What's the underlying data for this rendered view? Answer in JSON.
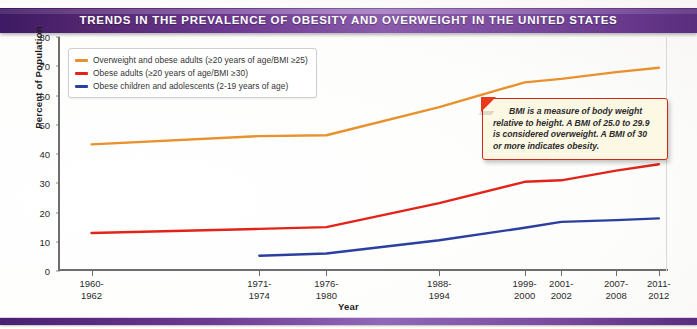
{
  "banner": {
    "title": "TRENDS IN THE PREVALENCE OF OBESITY AND OVERWEIGHT IN THE UNITED STATES"
  },
  "colors": {
    "banner_dark": "#3d1a63",
    "banner_light": "#8b5cab",
    "overweight_line": "#E8912D",
    "obese_adults_line": "#E32319",
    "obese_children_line": "#2B3F9E",
    "axis": "#6d6d6d",
    "callout_border": "#cf2a18",
    "callout_fill": "#fdf8e4"
  },
  "legend": {
    "items": [
      {
        "label": "Overweight and obese adults (≥20 years of age/BMI ≥25)",
        "color": "#E8912D"
      },
      {
        "label": "Obese adults (≥20 years of age/BMI ≥30)",
        "color": "#E32319"
      },
      {
        "label": "Obese children and adolescents (2-19 years of age)",
        "color": "#2B3F9E"
      }
    ]
  },
  "callout": {
    "text": "BMI is a measure of body weight relative to height. A BMI of 25.0 to 29.9 is considered overweight.  A BMI of 30 or more indicates obesity."
  },
  "chart_data": {
    "type": "line",
    "title": "TRENDS IN THE PREVALENCE OF OBESITY AND OVERWEIGHT IN THE UNITED STATES",
    "xlabel": "Year",
    "ylabel": "Percent of Population",
    "ylim": [
      0,
      80
    ],
    "yticks": [
      0,
      10,
      20,
      30,
      40,
      50,
      60,
      70,
      80
    ],
    "grid": false,
    "legend_position": "top-left",
    "categories": [
      "1960-\n1962",
      "1971-\n1974",
      "1976-\n1980",
      "1988-\n1994",
      "1999-\n2000",
      "2001-\n2002",
      "2007-\n2008",
      "2011-\n2012"
    ],
    "category_lines": [
      [
        "1960-",
        "1962"
      ],
      [
        "1971-",
        "1974"
      ],
      [
        "1976-",
        "1980"
      ],
      [
        "1988-",
        "1994"
      ],
      [
        "1999-",
        "2000"
      ],
      [
        "2001-",
        "2002"
      ],
      [
        "2007-",
        "2008"
      ],
      [
        "2011-",
        "2012"
      ]
    ],
    "category_positions_pct": [
      5.5,
      33.0,
      44.0,
      62.5,
      76.5,
      82.5,
      91.5,
      98.5
    ],
    "series": [
      {
        "name": "Overweight and obese adults (≥20 years of age/BMI ≥25)",
        "color": "#E8912D",
        "values": [
          43.3,
          46.1,
          46.4,
          56.0,
          64.5,
          65.7,
          68.0,
          69.5
        ]
      },
      {
        "name": "Obese adults (≥20 years of age/BMI ≥30)",
        "color": "#E32319",
        "values": [
          13.0,
          14.4,
          15.0,
          23.2,
          30.5,
          31.0,
          34.3,
          36.5
        ]
      },
      {
        "name": "Obese children and adolescents (2-19 years of age)",
        "color": "#2B3F9E",
        "values": [
          null,
          5.2,
          6.0,
          10.5,
          14.8,
          16.8,
          17.4,
          18.0
        ]
      }
    ]
  }
}
